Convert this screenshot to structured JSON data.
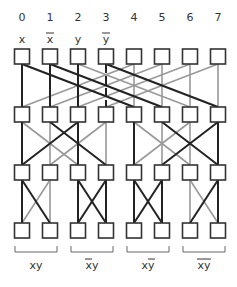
{
  "diagram": {
    "type": "butterfly-network",
    "column_indices": [
      "0",
      "1",
      "2",
      "3",
      "4",
      "5",
      "6",
      "7"
    ],
    "input_labels": [
      {
        "col": 0,
        "text": "x",
        "overline": false
      },
      {
        "col": 1,
        "text": "x",
        "overline": true
      },
      {
        "col": 2,
        "text": "y",
        "overline": false
      },
      {
        "col": 3,
        "text": "y",
        "overline": true
      }
    ],
    "rows": 4,
    "columns": 8,
    "colors": {
      "active": "#222222",
      "inactive": "#999999",
      "box": "#333333"
    },
    "stages": [
      {
        "name": "stage-1",
        "edges": [
          {
            "from": 0,
            "to": 0,
            "active": true
          },
          {
            "from": 0,
            "to": 4,
            "active": true
          },
          {
            "from": 1,
            "to": 1,
            "active": true
          },
          {
            "from": 1,
            "to": 5,
            "active": true
          },
          {
            "from": 2,
            "to": 2,
            "active": true
          },
          {
            "from": 2,
            "to": 6,
            "active": false
          },
          {
            "from": 3,
            "to": 3,
            "active": true,
            "dashed": true
          },
          {
            "from": 3,
            "to": 7,
            "active": true
          },
          {
            "from": 4,
            "to": 0,
            "active": false
          },
          {
            "from": 4,
            "to": 4,
            "active": false
          },
          {
            "from": 5,
            "to": 1,
            "active": false
          },
          {
            "from": 5,
            "to": 5,
            "active": false
          },
          {
            "from": 6,
            "to": 2,
            "active": false
          },
          {
            "from": 6,
            "to": 6,
            "active": false
          },
          {
            "from": 7,
            "to": 3,
            "active": false
          },
          {
            "from": 7,
            "to": 7,
            "active": false
          }
        ]
      },
      {
        "name": "stage-2",
        "edges": [
          {
            "from": 0,
            "to": 0,
            "active": true
          },
          {
            "from": 0,
            "to": 2,
            "active": false
          },
          {
            "from": 1,
            "to": 1,
            "active": false
          },
          {
            "from": 1,
            "to": 3,
            "active": true
          },
          {
            "from": 2,
            "to": 0,
            "active": true
          },
          {
            "from": 2,
            "to": 2,
            "active": true
          },
          {
            "from": 3,
            "to": 1,
            "active": false
          },
          {
            "from": 3,
            "to": 3,
            "active": false
          },
          {
            "from": 4,
            "to": 4,
            "active": true
          },
          {
            "from": 4,
            "to": 6,
            "active": false
          },
          {
            "from": 5,
            "to": 5,
            "active": false
          },
          {
            "from": 5,
            "to": 7,
            "active": true
          },
          {
            "from": 6,
            "to": 4,
            "active": false
          },
          {
            "from": 6,
            "to": 6,
            "active": false
          },
          {
            "from": 7,
            "to": 5,
            "active": true
          },
          {
            "from": 7,
            "to": 7,
            "active": true
          }
        ]
      },
      {
        "name": "stage-3",
        "edges": [
          {
            "from": 0,
            "to": 0,
            "active": true
          },
          {
            "from": 0,
            "to": 1,
            "active": true
          },
          {
            "from": 1,
            "to": 0,
            "active": false
          },
          {
            "from": 1,
            "to": 1,
            "active": false
          },
          {
            "from": 2,
            "to": 2,
            "active": true
          },
          {
            "from": 2,
            "to": 3,
            "active": true
          },
          {
            "from": 3,
            "to": 2,
            "active": true
          },
          {
            "from": 3,
            "to": 3,
            "active": true
          },
          {
            "from": 4,
            "to": 4,
            "active": true
          },
          {
            "from": 4,
            "to": 5,
            "active": true
          },
          {
            "from": 5,
            "to": 4,
            "active": true
          },
          {
            "from": 5,
            "to": 5,
            "active": true
          },
          {
            "from": 6,
            "to": 6,
            "active": false
          },
          {
            "from": 6,
            "to": 7,
            "active": false
          },
          {
            "from": 7,
            "to": 6,
            "active": true
          },
          {
            "from": 7,
            "to": 7,
            "active": true
          }
        ]
      }
    ],
    "output_groups": [
      {
        "cols": [
          0,
          1
        ],
        "label": "xy",
        "overline_chars": []
      },
      {
        "cols": [
          2,
          3
        ],
        "label": "xy",
        "overline_chars": [
          0
        ]
      },
      {
        "cols": [
          4,
          5
        ],
        "label": "xy",
        "overline_chars": [
          1
        ]
      },
      {
        "cols": [
          6,
          7
        ],
        "label": "xy",
        "overline_chars": [
          0,
          1
        ]
      }
    ]
  }
}
